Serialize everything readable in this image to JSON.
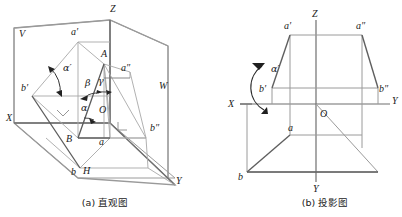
{
  "figure": {
    "title": "",
    "captions": [
      {
        "id": "caption-a",
        "text": "(a) 直观图",
        "x": 105,
        "y": 203
      },
      {
        "id": "caption-b",
        "text": "(b) 投影图",
        "x": 325,
        "y": 203
      }
    ],
    "colors": {
      "line_light": "#9a9a9a",
      "line_mid": "#7d7d7d",
      "line_dark": "#4a4a4a",
      "text": "#1a1a1a",
      "background": "#ffffff"
    },
    "panel_a": {
      "name": "pictorial-view",
      "caption": "(a) 直观图",
      "labels": [
        {
          "name": "label-V",
          "text": "V",
          "x": 19,
          "y": 37
        },
        {
          "name": "label-Z",
          "text": "Z",
          "x": 110,
          "y": 12
        },
        {
          "name": "label-a-prime",
          "text": "a′",
          "x": 71,
          "y": 35
        },
        {
          "name": "label-A",
          "text": "A",
          "x": 101,
          "y": 57
        },
        {
          "name": "label-a-dblprime",
          "text": "a″",
          "x": 121,
          "y": 71
        },
        {
          "name": "label-W",
          "text": "W",
          "x": 159,
          "y": 89
        },
        {
          "name": "label-b-prime",
          "text": "b′",
          "x": 21,
          "y": 91
        },
        {
          "name": "label-X",
          "text": "X",
          "x": 6,
          "y": 121
        },
        {
          "name": "label-B",
          "text": "B",
          "x": 66,
          "y": 142
        },
        {
          "name": "label-O",
          "text": "O",
          "x": 99,
          "y": 113
        },
        {
          "name": "label-a",
          "text": "a",
          "x": 99,
          "y": 145
        },
        {
          "name": "label-b",
          "text": "b",
          "x": 71,
          "y": 175
        },
        {
          "name": "label-H",
          "text": "H",
          "x": 83,
          "y": 174
        },
        {
          "name": "label-b-dblprime",
          "text": "b″",
          "x": 150,
          "y": 131
        },
        {
          "name": "label-Y",
          "text": "Y",
          "x": 176,
          "y": 184
        },
        {
          "name": "label-alpha",
          "text": "α",
          "x": 81,
          "y": 111
        },
        {
          "name": "label-beta",
          "text": "β",
          "x": 85,
          "y": 86
        },
        {
          "name": "label-gamma",
          "text": "γ",
          "x": 98,
          "y": 84
        },
        {
          "name": "label-alpha-prime",
          "text": "α′",
          "x": 63,
          "y": 71
        }
      ]
    },
    "panel_b": {
      "name": "orthographic-view",
      "caption": "(b) 投影图",
      "labels": [
        {
          "name": "label-Z",
          "text": "Z",
          "x": 312,
          "y": 17
        },
        {
          "name": "label-a-prime",
          "text": "a′",
          "x": 287,
          "y": 28
        },
        {
          "name": "label-a-dblprime",
          "text": "a″",
          "x": 355,
          "y": 28
        },
        {
          "name": "label-b-prime",
          "text": "b′",
          "x": 268,
          "y": 92
        },
        {
          "name": "label-b-dblprime",
          "text": "b″",
          "x": 372,
          "y": 92
        },
        {
          "name": "label-X",
          "text": "X",
          "x": 232,
          "y": 106
        },
        {
          "name": "label-Y-right",
          "text": "Y",
          "x": 392,
          "y": 104
        },
        {
          "name": "label-O",
          "text": "O",
          "x": 320,
          "y": 117
        },
        {
          "name": "label-a",
          "text": "a",
          "x": 294,
          "y": 135
        },
        {
          "name": "label-b",
          "text": "b",
          "x": 241,
          "y": 173
        },
        {
          "name": "label-Y-bottom",
          "text": "Y",
          "x": 320,
          "y": 186
        },
        {
          "name": "label-alpha-prime",
          "text": "α′",
          "x": 271,
          "y": 72
        }
      ]
    }
  }
}
